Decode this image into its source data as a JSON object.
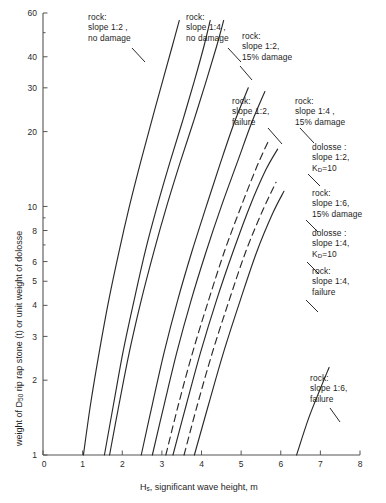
{
  "figure": {
    "title": "",
    "x_axis_title_main": "H",
    "x_axis_title_sub": "s",
    "x_axis_title_rest": ", significant wave height, m",
    "y_axis_title_a": "weight of D",
    "y_axis_title_sub": "50",
    "y_axis_title_b": " rip rap stone (t) or unit weight of dolosse"
  },
  "annotations": [
    {
      "id": "rock-1-2-no-damage",
      "lines": "rock:\nslope 1:2 ,\nno damage"
    },
    {
      "id": "rock-1-4-no-damage",
      "lines": "rock:\nslope 1:4 ,\nno damage"
    },
    {
      "id": "rock-1-2-15-damage",
      "lines": "rock:\nslope 1:2,\n15% damage"
    },
    {
      "id": "rock-1-2-failure",
      "lines": "rock:\nslope 1:2,\nfailure"
    },
    {
      "id": "rock-1-4-15-damage",
      "lines": "rock:\nslope 1:4 ,\n15% damage"
    },
    {
      "id": "dolosse-1-2-kd10",
      "lines": "dolosse :\nslope 1:2,\nK",
      "sub": "D",
      "tail": "=10"
    },
    {
      "id": "rock-1-6-15-damage",
      "lines": "rock:\nslope 1:6,\n15% damage"
    },
    {
      "id": "dolosse-1-4-kd10",
      "lines": "dolosse :\nslope 1:4,\nK",
      "sub": "D",
      "tail": "=10"
    },
    {
      "id": "rock-1-4-failure",
      "lines": "rock:\nslope 1:4,\nfailure"
    },
    {
      "id": "rock-1-6-failure",
      "lines": "rock:\nslope 1:6,\nfailure"
    }
  ],
  "chart_data": {
    "type": "line",
    "title": "",
    "xlabel": "Hs, significant wave height, m",
    "ylabel": "weight of D50 rip rap stone (t) or unit weight of dolosse",
    "xscale": "linear",
    "yscale": "log",
    "xlim": [
      0,
      8
    ],
    "ylim": [
      1,
      60
    ],
    "grid": false,
    "legend": "inline-annotations",
    "xticks": [
      0,
      1,
      2,
      3,
      4,
      5,
      6,
      7,
      8
    ],
    "yticks": [
      1,
      2,
      3,
      4,
      5,
      6,
      8,
      10,
      20,
      30,
      40,
      60
    ],
    "series": [
      {
        "name": "rock: slope 1:2, no damage",
        "style": "solid",
        "points": [
          [
            1.02,
            1.0
          ],
          [
            1.2,
            1.6
          ],
          [
            1.42,
            2.6
          ],
          [
            1.66,
            4.2
          ],
          [
            1.92,
            6.6
          ],
          [
            2.18,
            10.0
          ],
          [
            2.46,
            15.0
          ],
          [
            2.74,
            22.0
          ],
          [
            3.02,
            32.0
          ],
          [
            3.26,
            44.0
          ],
          [
            3.44,
            56.0
          ]
        ]
      },
      {
        "name": "rock: slope 1:4, no damage",
        "style": "solid",
        "points": [
          [
            1.55,
            1.0
          ],
          [
            1.78,
            1.6
          ],
          [
            2.02,
            2.6
          ],
          [
            2.3,
            4.2
          ],
          [
            2.58,
            6.6
          ],
          [
            2.88,
            10.0
          ],
          [
            3.2,
            15.0
          ],
          [
            3.52,
            22.0
          ],
          [
            3.82,
            32.0
          ],
          [
            4.06,
            44.0
          ],
          [
            4.22,
            56.0
          ]
        ]
      },
      {
        "name": "rock: slope 1:2, 15% damage",
        "style": "solid",
        "points": [
          [
            1.68,
            1.0
          ],
          [
            1.92,
            1.6
          ],
          [
            2.18,
            2.6
          ],
          [
            2.48,
            4.2
          ],
          [
            2.8,
            6.6
          ],
          [
            3.12,
            10.0
          ],
          [
            3.46,
            15.0
          ],
          [
            3.8,
            22.0
          ],
          [
            4.12,
            32.0
          ],
          [
            4.38,
            44.0
          ],
          [
            4.56,
            56.0
          ]
        ]
      },
      {
        "name": "rock: slope 1:2, failure",
        "style": "solid",
        "points": [
          [
            2.48,
            1.0
          ],
          [
            2.76,
            1.6
          ],
          [
            3.06,
            2.6
          ],
          [
            3.4,
            4.2
          ],
          [
            3.76,
            6.6
          ],
          [
            4.12,
            10.0
          ],
          [
            4.48,
            15.0
          ],
          [
            4.84,
            22.0
          ],
          [
            5.18,
            30.0
          ]
        ]
      },
      {
        "name": "rock: slope 1:4, 15% damage",
        "style": "solid",
        "points": [
          [
            2.76,
            1.0
          ],
          [
            3.06,
            1.6
          ],
          [
            3.38,
            2.6
          ],
          [
            3.74,
            4.2
          ],
          [
            4.12,
            6.6
          ],
          [
            4.5,
            10.0
          ],
          [
            4.9,
            15.0
          ],
          [
            5.28,
            22.0
          ],
          [
            5.6,
            29.0
          ]
        ]
      },
      {
        "name": "dolosse: slope 1:2, KD=10",
        "style": "dashed",
        "points": [
          [
            3.1,
            1.0
          ],
          [
            3.42,
            1.6
          ],
          [
            3.78,
            2.6
          ],
          [
            4.18,
            4.2
          ],
          [
            4.58,
            6.6
          ],
          [
            5.0,
            10.0
          ],
          [
            5.4,
            14.5
          ],
          [
            5.7,
            18.5
          ]
        ]
      },
      {
        "name": "rock: slope 1:6, 15% damage",
        "style": "solid",
        "points": [
          [
            3.28,
            1.0
          ],
          [
            3.62,
            1.6
          ],
          [
            3.98,
            2.6
          ],
          [
            4.38,
            4.2
          ],
          [
            4.8,
            6.6
          ],
          [
            5.22,
            10.0
          ],
          [
            5.62,
            14.0
          ],
          [
            5.92,
            17.0
          ]
        ]
      },
      {
        "name": "dolosse: slope 1:4, KD=10",
        "style": "dashed",
        "points": [
          [
            3.56,
            1.0
          ],
          [
            3.9,
            1.6
          ],
          [
            4.28,
            2.6
          ],
          [
            4.7,
            4.2
          ],
          [
            5.12,
            6.6
          ],
          [
            5.54,
            9.6
          ],
          [
            5.88,
            12.5
          ]
        ]
      },
      {
        "name": "rock: slope 1:4, failure",
        "style": "solid",
        "points": [
          [
            3.82,
            1.0
          ],
          [
            4.18,
            1.6
          ],
          [
            4.56,
            2.6
          ],
          [
            4.98,
            4.2
          ],
          [
            5.4,
            6.6
          ],
          [
            5.8,
            9.4
          ],
          [
            6.08,
            11.5
          ]
        ]
      },
      {
        "name": "rock: slope 1:6, failure",
        "style": "solid",
        "points": [
          [
            6.4,
            1.0
          ],
          [
            6.7,
            1.4
          ],
          [
            7.0,
            1.85
          ],
          [
            7.22,
            2.25
          ]
        ]
      }
    ]
  }
}
